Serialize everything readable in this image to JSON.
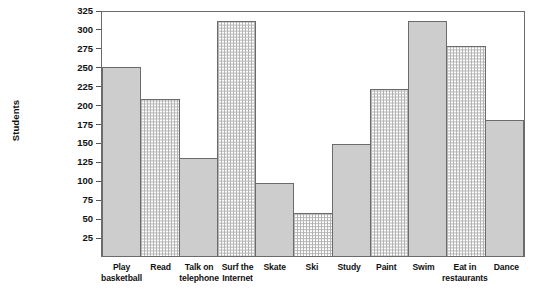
{
  "chart_data": {
    "type": "bar",
    "title": "",
    "xlabel": "",
    "ylabel": "Students",
    "ylim": [
      0,
      325
    ],
    "ytick_step": 25,
    "grid": false,
    "legend": "none",
    "yticks": [
      325,
      300,
      275,
      250,
      225,
      200,
      175,
      150,
      125,
      100,
      75,
      50,
      25
    ],
    "categories": [
      "Play\nbasketball",
      "Read",
      "Talk on\ntelephone",
      "Surf the\nInternet",
      "Skate",
      "Ski",
      "Study",
      "Paint",
      "Swim",
      "Eat in\nrestaurants",
      "Dance"
    ],
    "values": [
      250,
      208,
      130,
      310,
      97,
      57,
      148,
      220,
      310,
      278,
      180
    ],
    "fills": [
      "solid",
      "dotted",
      "solid",
      "dotted",
      "solid",
      "dotted",
      "solid",
      "dotted",
      "solid",
      "dotted",
      "solid"
    ],
    "colors": {
      "bar_solid": "#cdcdcd",
      "bar_dotted": "#ffffff",
      "bar_outline": "#6b6b6b",
      "axis": "#555555",
      "text": "#111111",
      "background": "#ffffff"
    }
  }
}
